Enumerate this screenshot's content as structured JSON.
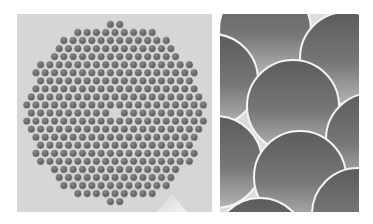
{
  "figure": {
    "panels": [
      {
        "id": "left",
        "description": "Cross-section of hexagonally packed fiber bundle (overview)",
        "background": "#d6d6d6",
        "fiber_color_dark": "#5a5a5a",
        "fiber_color_light": "#9a9a9a",
        "bundle_center": [
          98,
          99
        ],
        "bundle_radius": 93,
        "fiber_pitch": 9.3,
        "fiber_radius": 3.9,
        "missing_center_fiber": true
      },
      {
        "id": "right",
        "description": "Magnified view of individual fibers",
        "background": "#dcdcdc",
        "fiber_color_dark": "#606060",
        "fiber_color_light": "#a8a8a8",
        "fibers": [
          [
            45,
            16,
            46
          ],
          [
            126,
            44,
            46
          ],
          [
            -8,
            66,
            46
          ],
          [
            73,
            92,
            46
          ],
          [
            152,
            125,
            46
          ],
          [
            -4,
            148,
            46
          ],
          [
            80,
            163,
            46
          ],
          [
            138,
            200,
            46
          ],
          [
            40,
            230,
            46
          ]
        ]
      }
    ]
  }
}
